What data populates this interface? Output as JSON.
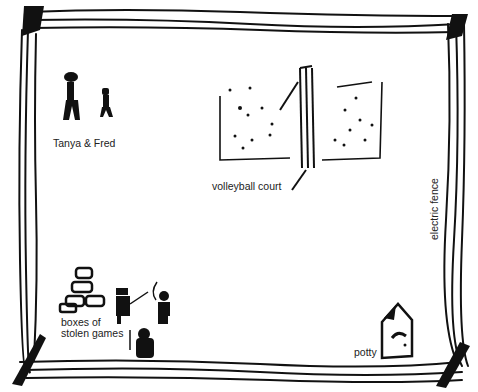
{
  "diagram": {
    "type": "hand-drawn map",
    "colors": {
      "ink": "#111111",
      "background": "#ffffff",
      "label": "#222222"
    },
    "labels": {
      "people": "Tanya & Fred",
      "court": "volleyball court",
      "fence": "electric fence",
      "boxes_line1": "boxes of",
      "boxes_line2": "stolen games",
      "potty": "potty"
    },
    "elements": [
      {
        "id": "electric-fence",
        "shape": "border",
        "label": "electric fence"
      },
      {
        "id": "tanya-fred",
        "shape": "two stick figures",
        "label": "Tanya & Fred"
      },
      {
        "id": "volleyball-court",
        "shape": "court with net",
        "label": "volleyball court"
      },
      {
        "id": "boxes",
        "shape": "stacked boxes",
        "label": "boxes of stolen games"
      },
      {
        "id": "pirates",
        "shape": "three pirate figures"
      },
      {
        "id": "potty",
        "shape": "outhouse",
        "label": "potty"
      }
    ]
  }
}
